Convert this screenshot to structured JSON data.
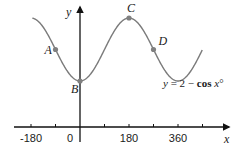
{
  "chart_data": {
    "type": "line",
    "title": "",
    "xlabel": "x",
    "ylabel": "y",
    "xlim": [
      -180,
      540
    ],
    "ylim": [
      0,
      3
    ],
    "grid": false,
    "x_ticks": [
      -180,
      -90,
      0,
      90,
      180,
      270,
      360,
      450
    ],
    "x_tick_labels": [
      {
        "value": -180,
        "label": "-180"
      },
      {
        "value": 0,
        "label": "0"
      },
      {
        "value": 180,
        "label": "180"
      },
      {
        "value": 360,
        "label": "360"
      }
    ],
    "series": [
      {
        "name": "y = 2 − cos x°",
        "function": "2 - cos(x deg)",
        "x_range": [
          -175,
          450
        ],
        "color": "#7a7a7a"
      }
    ],
    "points": [
      {
        "label": "A",
        "x": -90,
        "y": 2
      },
      {
        "label": "B",
        "x": 0,
        "y": 1
      },
      {
        "label": "C",
        "x": 180,
        "y": 3
      },
      {
        "label": "D",
        "x": 270,
        "y": 2
      }
    ],
    "annotation": {
      "y_part": "y",
      "eq_part": " = 2 − ",
      "cos_part": "cos",
      "x_part": " x",
      "deg_part": "°"
    },
    "colors": {
      "axis": "#111111",
      "curve": "#7a7a7a",
      "point": "#808080"
    }
  }
}
